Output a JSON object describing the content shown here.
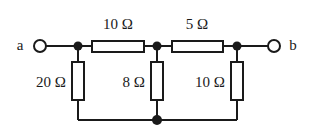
{
  "figure": {
    "type": "circuit-diagram",
    "background_color": "#ffffff",
    "line_color": "#1a1a1a",
    "text_color": "#1a1a1a"
  },
  "terminals": [
    {
      "id": "a",
      "label": "a",
      "side": "left",
      "x": 40,
      "y": 46,
      "label_x": 20,
      "label_y": 45
    },
    {
      "id": "b",
      "label": "b",
      "side": "right",
      "x": 274,
      "y": 46,
      "label_x": 293,
      "label_y": 45
    }
  ],
  "nodes": [
    {
      "id": "n1",
      "x": 78,
      "y": 46
    },
    {
      "id": "n2",
      "x": 157,
      "y": 46
    },
    {
      "id": "n3",
      "x": 237,
      "y": 46
    },
    {
      "id": "ngnd",
      "x": 157,
      "y": 120
    }
  ],
  "series_resistors": [
    {
      "id": "R_series_1",
      "value": "10 Ω",
      "orientation": "horizontal",
      "box": {
        "x": 92,
        "y": 41,
        "width": 52,
        "height": 11
      },
      "label_x": 118,
      "label_y": 24
    },
    {
      "id": "R_series_2",
      "value": "5 Ω",
      "orientation": "horizontal",
      "box": {
        "x": 172,
        "y": 41,
        "width": 51,
        "height": 11
      },
      "label_x": 197,
      "label_y": 24
    }
  ],
  "shunt_resistors": [
    {
      "id": "R_shunt_1",
      "value": "20 Ω",
      "orientation": "vertical",
      "box": {
        "x": 72,
        "y": 62,
        "width": 12,
        "height": 38
      },
      "label_x": 66,
      "label_y": 82
    },
    {
      "id": "R_shunt_2",
      "value": "8 Ω",
      "orientation": "vertical",
      "box": {
        "x": 151,
        "y": 62,
        "width": 12,
        "height": 38
      },
      "label_x": 145,
      "label_y": 82
    },
    {
      "id": "R_shunt_3",
      "value": "10 Ω",
      "orientation": "vertical",
      "box": {
        "x": 231,
        "y": 62,
        "width": 12,
        "height": 38
      },
      "label_x": 225,
      "label_y": 82
    }
  ],
  "wires": {
    "top_rail_y": 46,
    "bottom_rail_y": 120,
    "left_x": 78,
    "right_x": 237
  }
}
